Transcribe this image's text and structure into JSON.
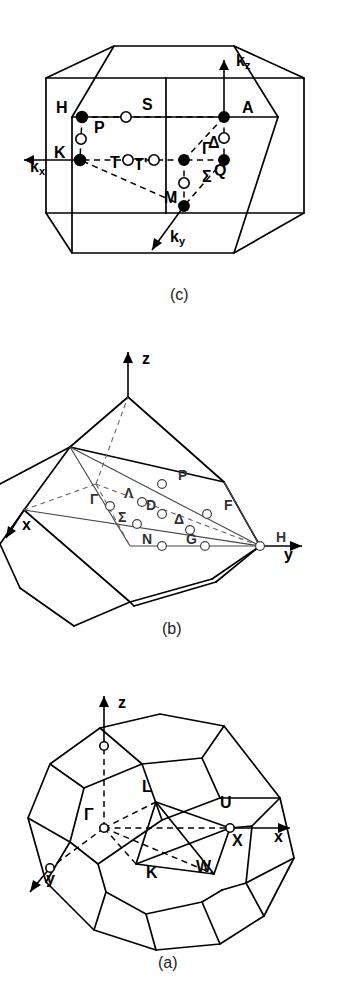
{
  "figure": {
    "background_color": "#ffffff",
    "line_color": "#000000",
    "rotation_degrees": 90,
    "panel_count": 3
  },
  "panels": [
    {
      "id": "a",
      "caption": "(a)",
      "lattice": "face-centred cubic",
      "zone_shape": "truncated octahedron",
      "axes": [
        {
          "name": "x",
          "label": "x"
        },
        {
          "name": "y",
          "label": "y"
        },
        {
          "name": "z",
          "label": "z"
        }
      ],
      "symmetry_points": [
        {
          "label": "Γ",
          "name": "gamma",
          "marker": "open"
        },
        {
          "label": "X",
          "name": "x-point",
          "marker": "open"
        },
        {
          "label": "L",
          "name": "l-point",
          "marker": "open"
        },
        {
          "label": "W",
          "name": "w-point",
          "marker": "open"
        },
        {
          "label": "K",
          "name": "k-point",
          "marker": "open"
        },
        {
          "label": "U",
          "name": "u-point",
          "marker": "open"
        }
      ]
    },
    {
      "id": "b",
      "caption": "(b)",
      "lattice": "body-centred cubic",
      "zone_shape": "rhombic dodecahedron",
      "axes": [
        {
          "name": "x",
          "label": "x"
        },
        {
          "name": "y",
          "label": "y"
        },
        {
          "name": "z",
          "label": "z"
        }
      ],
      "symmetry_points": [
        {
          "label": "Γ",
          "name": "gamma",
          "marker": "open"
        },
        {
          "label": "H",
          "name": "h-point",
          "marker": "open"
        },
        {
          "label": "P",
          "name": "p-point",
          "marker": "open"
        },
        {
          "label": "N",
          "name": "n-point",
          "marker": "open"
        },
        {
          "label": "F",
          "name": "f-line",
          "marker": "open"
        },
        {
          "label": "G",
          "name": "g-line",
          "marker": "open"
        },
        {
          "label": "D",
          "name": "d-line",
          "marker": "open"
        },
        {
          "label": "Δ",
          "name": "delta-line",
          "marker": "open"
        },
        {
          "label": "Λ",
          "name": "lambda-line",
          "marker": "open"
        },
        {
          "label": "Σ",
          "name": "sigma-line",
          "marker": "open"
        }
      ]
    },
    {
      "id": "c",
      "caption": "(c)",
      "lattice": "hexagonal",
      "zone_shape": "hexagonal prism",
      "axes": [
        {
          "name": "kx",
          "label": "k",
          "sub": "x"
        },
        {
          "name": "ky",
          "label": "k",
          "sub": "y"
        },
        {
          "name": "kz",
          "label": "k",
          "sub": "z"
        }
      ],
      "symmetry_points": [
        {
          "label": "Γ",
          "name": "gamma",
          "marker": "filled"
        },
        {
          "label": "A",
          "name": "a-point",
          "marker": "filled"
        },
        {
          "label": "H",
          "name": "h-point",
          "marker": "filled"
        },
        {
          "label": "K",
          "name": "k-point",
          "marker": "filled"
        },
        {
          "label": "M",
          "name": "m-point",
          "marker": "filled"
        },
        {
          "label": "L",
          "name": "l-point",
          "marker": "filled"
        },
        {
          "label": "Δ",
          "name": "delta-line",
          "marker": "open"
        },
        {
          "label": "Σ",
          "name": "sigma-line",
          "marker": "open"
        },
        {
          "label": "T",
          "name": "t-line",
          "marker": "open"
        },
        {
          "label": "T'",
          "name": "t-prime-line",
          "marker": "open"
        },
        {
          "label": "S",
          "name": "s-line",
          "marker": "open"
        },
        {
          "label": "P",
          "name": "p-line",
          "marker": "open"
        },
        {
          "label": "Q",
          "name": "q-line",
          "marker": "open"
        },
        {
          "label": "R",
          "name": "r-line",
          "marker": "open"
        },
        {
          "label": "U",
          "name": "u-line",
          "marker": "open"
        }
      ]
    }
  ],
  "labels": {
    "a": {
      "cap": "(a)",
      "x": "x",
      "y": "y",
      "z": "z",
      "gamma": "Γ",
      "X": "X",
      "L": "L",
      "W": "W",
      "K": "K",
      "U": "U"
    },
    "b": {
      "cap": "(b)",
      "x": "x",
      "y": "y",
      "z": "z",
      "gamma": "Γ",
      "H": "H",
      "P": "P",
      "N": "N",
      "F": "F",
      "G": "G",
      "D": "D",
      "Delta": "Δ",
      "Lambda": "Λ",
      "Sigma": "Σ"
    },
    "c": {
      "cap": "(c)",
      "k": "k",
      "kx_sub": "x",
      "ky_sub": "y",
      "kz_sub": "z",
      "gamma": "Γ",
      "A": "A",
      "H": "H",
      "K": "K",
      "M": "M",
      "Delta": "Δ",
      "Sigma": "Σ",
      "T": "T",
      "Tp": "T'",
      "S": "S",
      "P": "P",
      "Q": "Q",
      "L": "L"
    }
  }
}
